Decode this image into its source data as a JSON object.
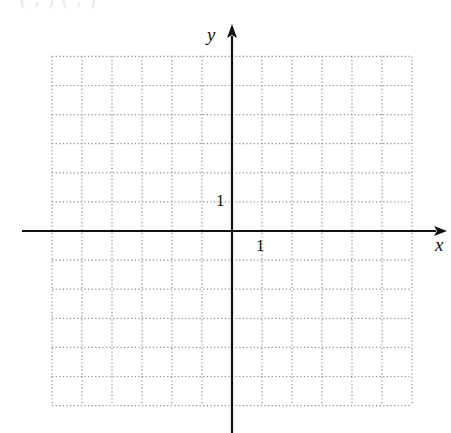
{
  "header": {
    "cutoff_text": "( , ) ( , )"
  },
  "chart_data": {
    "type": "coordinate-grid",
    "title": "",
    "xlabel": "x",
    "ylabel": "y",
    "x_range": [
      -6,
      6
    ],
    "y_range": [
      -6,
      6
    ],
    "grid": true,
    "grid_style": "dotted",
    "tick_labels": [
      {
        "axis": "x",
        "value": 1,
        "label": "1"
      },
      {
        "axis": "y",
        "value": 1,
        "label": "1"
      }
    ],
    "series": []
  },
  "axes": {
    "x_label": "x",
    "y_label": "y",
    "x_tick_label": "1",
    "y_tick_label": "1"
  },
  "colors": {
    "axis": "#111111",
    "grid": "#8a8a8a",
    "text": "#111111"
  }
}
